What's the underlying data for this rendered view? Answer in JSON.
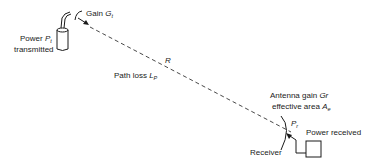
{
  "diagram": {
    "type": "radio-link-budget",
    "transmitter": {
      "power_label": "Power",
      "power_symbol": "P",
      "power_subscript": "t",
      "caption": "transmitted",
      "gain_label": "Gain",
      "gain_symbol": "G",
      "gain_subscript": "t"
    },
    "path": {
      "distance_symbol": "R",
      "loss_label": "Path loss",
      "loss_symbol": "L",
      "loss_subscript": "P"
    },
    "receiver": {
      "antenna_gain_label": "Antenna gain",
      "antenna_gain_symbol": "Gr",
      "effective_area_label": "effective area",
      "effective_area_symbol": "A",
      "effective_area_subscript": "e",
      "power_symbol": "P",
      "power_subscript": "r",
      "power_label": "Power received",
      "caption": "Receiver"
    },
    "colors": {
      "stroke": "#1a1a1a",
      "background": "#ffffff"
    }
  }
}
